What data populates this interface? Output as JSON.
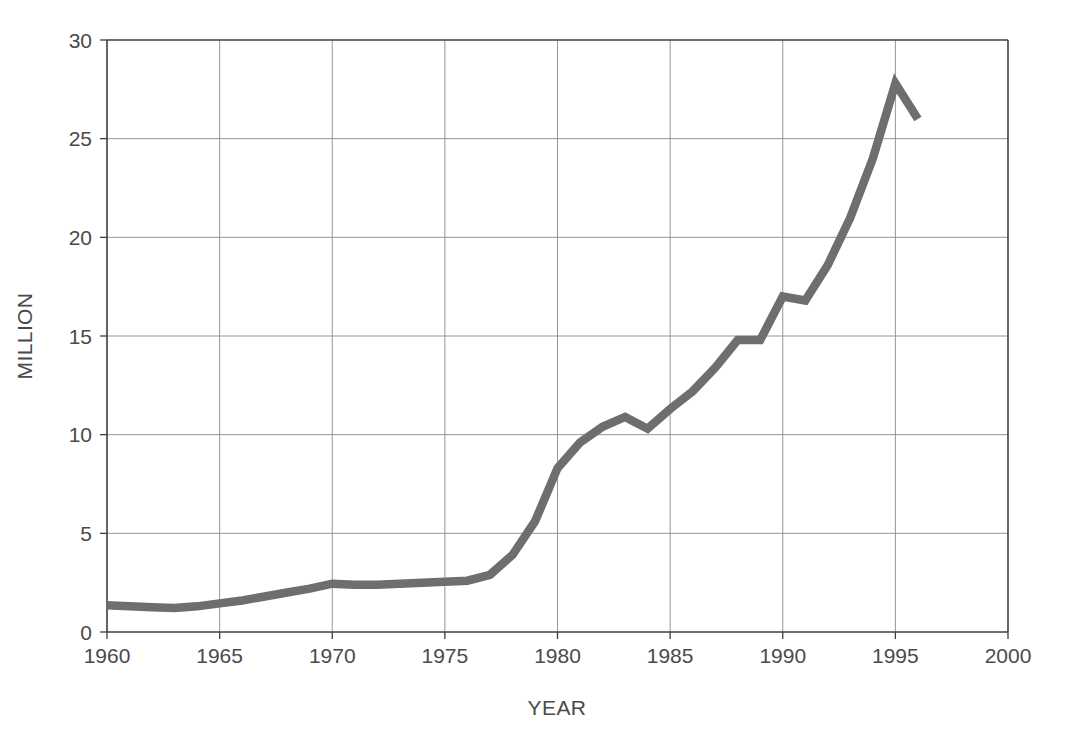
{
  "chart_data": {
    "type": "line",
    "title": "",
    "xlabel": "YEAR",
    "ylabel": "MILLION",
    "xlim": [
      1960,
      2000
    ],
    "ylim": [
      0,
      30
    ],
    "xticks": [
      1960,
      1965,
      1970,
      1975,
      1980,
      1985,
      1990,
      1995,
      2000
    ],
    "yticks": [
      0,
      5,
      10,
      15,
      20,
      25,
      30
    ],
    "grid": true,
    "legend": null,
    "series": [
      {
        "name": "",
        "color": "#6e6e6e",
        "x": [
          1960,
          1961,
          1962,
          1963,
          1964,
          1965,
          1966,
          1967,
          1968,
          1969,
          1970,
          1971,
          1972,
          1973,
          1974,
          1975,
          1976,
          1977,
          1978,
          1979,
          1980,
          1981,
          1982,
          1983,
          1984,
          1985,
          1986,
          1987,
          1988,
          1989,
          1990,
          1991,
          1992,
          1993,
          1994,
          1995,
          1996
        ],
        "values": [
          1.35,
          1.3,
          1.25,
          1.22,
          1.3,
          1.45,
          1.6,
          1.8,
          2.0,
          2.2,
          2.45,
          2.4,
          2.4,
          2.45,
          2.5,
          2.55,
          2.6,
          2.9,
          3.9,
          5.6,
          8.3,
          9.6,
          10.4,
          10.9,
          10.3,
          11.3,
          12.2,
          13.4,
          14.8,
          14.8,
          17.0,
          16.8,
          18.6,
          21.0,
          24.0,
          27.8,
          26.0
        ]
      }
    ]
  },
  "axes": {
    "y_axis_title": "MILLION",
    "x_axis_title": "YEAR",
    "y_tick_labels": [
      "30",
      "25",
      "20",
      "15",
      "10",
      "5",
      "0"
    ],
    "x_tick_labels": [
      "1960",
      "1965",
      "1970",
      "1975",
      "1980",
      "1985",
      "1990",
      "1995",
      "2000"
    ]
  },
  "colors": {
    "line": "#6e6e6e",
    "grid": "#8a8a8a",
    "frame": "#3f3f3f",
    "text": "#4a4a4a",
    "background": "#ffffff"
  }
}
